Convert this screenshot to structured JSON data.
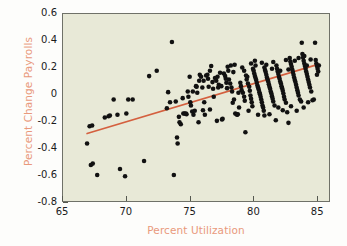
{
  "chart_data": {
    "type": "scatter",
    "title": "",
    "xlabel": "Percent Utilization",
    "ylabel": "Percent Change Payrolls",
    "xlim": [
      65,
      86
    ],
    "ylim": [
      -0.8,
      0.6
    ],
    "xticks": [
      65,
      70,
      75,
      80,
      85
    ],
    "xtick_labels": [
      "65",
      "70",
      "75",
      "80",
      "85"
    ],
    "yticks": [
      -0.8,
      -0.6,
      -0.4,
      -0.2,
      0,
      0.2,
      0.4,
      0.6
    ],
    "ytick_labels": [
      "-0.8",
      "-0.6",
      "-0.4",
      "-0.2",
      "0",
      "0.2",
      "0.4",
      "0.6"
    ],
    "grid": false,
    "legend": "none",
    "plot_background": "#e8e9d7",
    "point_color": "#111111",
    "point_size": 4.6,
    "label_color": "#e9997b",
    "tick_color": "#1b1b1b",
    "frame_color": "#6f7168",
    "series": [
      {
        "name": "Percent Change Payrolls vs Percent Utilization",
        "marker": "filled-circle",
        "points": [
          [
            66.9,
            -0.37
          ],
          [
            67.1,
            -0.24
          ],
          [
            67.3,
            -0.235
          ],
          [
            67.2,
            -0.53
          ],
          [
            67.35,
            -0.52
          ],
          [
            67.7,
            -0.605
          ],
          [
            68.3,
            -0.175
          ],
          [
            68.6,
            -0.165
          ],
          [
            68.7,
            -0.16
          ],
          [
            69.0,
            -0.04
          ],
          [
            69.3,
            -0.155
          ],
          [
            69.5,
            -0.56
          ],
          [
            69.9,
            -0.615
          ],
          [
            70.0,
            -0.145
          ],
          [
            70.15,
            -0.04
          ],
          [
            70.5,
            -0.04
          ],
          [
            71.4,
            -0.5
          ],
          [
            71.8,
            0.135
          ],
          [
            72.4,
            0.175
          ],
          [
            73.2,
            -0.105
          ],
          [
            73.45,
            -0.06
          ],
          [
            73.6,
            0.39
          ],
          [
            73.75,
            -0.605
          ],
          [
            73.9,
            -0.055
          ],
          [
            74.0,
            -0.325
          ],
          [
            74.05,
            -0.37
          ],
          [
            74.2,
            -0.21
          ],
          [
            74.3,
            -0.225
          ],
          [
            74.45,
            -0.03
          ],
          [
            74.5,
            -0.145
          ],
          [
            74.6,
            -0.145
          ],
          [
            74.7,
            -0.145
          ],
          [
            74.75,
            -0.15
          ],
          [
            74.85,
            0.02
          ],
          [
            74.9,
            -0.02
          ],
          [
            75.0,
            0.13
          ],
          [
            75.05,
            -0.06
          ],
          [
            75.1,
            -0.085
          ],
          [
            75.2,
            -0.13
          ],
          [
            75.3,
            -0.155
          ],
          [
            75.4,
            -0.125
          ],
          [
            75.5,
            0.06
          ],
          [
            75.55,
            0.055
          ],
          [
            75.6,
            0.01
          ],
          [
            75.7,
            -0.21
          ],
          [
            75.8,
            0.145
          ],
          [
            75.9,
            0.13
          ],
          [
            76.0,
            0.05
          ],
          [
            76.1,
            0.1
          ],
          [
            76.15,
            -0.06
          ],
          [
            76.2,
            -0.155
          ],
          [
            76.3,
            0.14
          ],
          [
            76.4,
            0.145
          ],
          [
            76.5,
            0.055
          ],
          [
            76.6,
            0.175
          ],
          [
            76.7,
            0.21
          ],
          [
            76.8,
            0.09
          ],
          [
            76.85,
            0.04
          ],
          [
            76.9,
            -0.02
          ],
          [
            77.0,
            0.12
          ],
          [
            77.1,
            0.1
          ],
          [
            77.2,
            0.13
          ],
          [
            77.25,
            0.05
          ],
          [
            77.3,
            0.07
          ],
          [
            77.4,
            0.16
          ],
          [
            77.5,
            0.06
          ],
          [
            77.55,
            -0.19
          ],
          [
            77.6,
            -0.185
          ],
          [
            77.7,
            0.155
          ],
          [
            77.8,
            0.135
          ],
          [
            77.85,
            0.115
          ],
          [
            77.9,
            0.085
          ],
          [
            78.0,
            0.205
          ],
          [
            78.05,
            0.175
          ],
          [
            78.1,
            0.11
          ],
          [
            78.2,
            0.08
          ],
          [
            78.3,
            0.05
          ],
          [
            78.35,
            0.02
          ],
          [
            78.4,
            -0.065
          ],
          [
            78.5,
            -0.04
          ],
          [
            78.6,
            -0.145
          ],
          [
            78.7,
            -0.15
          ],
          [
            78.75,
            -0.155
          ],
          [
            78.8,
            -0.15
          ],
          [
            78.9,
            -0.1
          ],
          [
            79.0,
            0.085
          ],
          [
            79.05,
            0.06
          ],
          [
            79.1,
            0.03
          ],
          [
            79.2,
            0.01
          ],
          [
            79.3,
            -0.02
          ],
          [
            79.35,
            -0.05
          ],
          [
            79.4,
            -0.285
          ],
          [
            79.5,
            0.11
          ],
          [
            79.55,
            0.13
          ],
          [
            79.6,
            0.08
          ],
          [
            79.7,
            0.055
          ],
          [
            79.75,
            0.025
          ],
          [
            79.8,
            -0.01
          ],
          [
            79.85,
            -0.035
          ],
          [
            79.9,
            -0.06
          ],
          [
            79.95,
            -0.09
          ],
          [
            80.0,
            0.19
          ],
          [
            80.05,
            0.175
          ],
          [
            80.1,
            0.155
          ],
          [
            80.15,
            0.135
          ],
          [
            80.2,
            0.12
          ],
          [
            80.25,
            0.105
          ],
          [
            80.3,
            0.085
          ],
          [
            80.35,
            0.065
          ],
          [
            80.4,
            0.05
          ],
          [
            80.45,
            0.035
          ],
          [
            80.5,
            0.015
          ],
          [
            80.55,
            0.0
          ],
          [
            80.6,
            -0.02
          ],
          [
            80.65,
            -0.04
          ],
          [
            80.7,
            -0.06
          ],
          [
            80.75,
            -0.085
          ],
          [
            80.8,
            -0.1
          ],
          [
            80.85,
            -0.125
          ],
          [
            80.9,
            0.2
          ],
          [
            80.95,
            0.18
          ],
          [
            81.0,
            0.165
          ],
          [
            81.05,
            0.145
          ],
          [
            81.1,
            0.125
          ],
          [
            81.15,
            0.11
          ],
          [
            81.2,
            0.095
          ],
          [
            81.25,
            0.075
          ],
          [
            81.3,
            0.055
          ],
          [
            81.35,
            0.04
          ],
          [
            81.4,
            0.02
          ],
          [
            81.45,
            0.005
          ],
          [
            81.5,
            -0.015
          ],
          [
            81.55,
            -0.035
          ],
          [
            81.6,
            -0.055
          ],
          [
            81.7,
            -0.085
          ],
          [
            81.8,
            -0.195
          ],
          [
            81.85,
            0.215
          ],
          [
            81.9,
            0.19
          ],
          [
            81.95,
            0.17
          ],
          [
            82.0,
            0.15
          ],
          [
            82.05,
            0.13
          ],
          [
            82.1,
            0.115
          ],
          [
            82.15,
            0.095
          ],
          [
            82.2,
            0.08
          ],
          [
            82.25,
            0.06
          ],
          [
            82.3,
            0.045
          ],
          [
            82.35,
            0.025
          ],
          [
            82.4,
            0.005
          ],
          [
            82.45,
            -0.02
          ],
          [
            82.5,
            -0.04
          ],
          [
            82.6,
            -0.065
          ],
          [
            82.7,
            -0.135
          ],
          [
            82.8,
            -0.215
          ],
          [
            82.9,
            0.27
          ],
          [
            82.95,
            0.245
          ],
          [
            83.0,
            0.225
          ],
          [
            83.05,
            0.205
          ],
          [
            83.1,
            0.185
          ],
          [
            83.15,
            0.165
          ],
          [
            83.2,
            0.145
          ],
          [
            83.25,
            0.125
          ],
          [
            83.3,
            0.105
          ],
          [
            83.35,
            0.09
          ],
          [
            83.4,
            0.07
          ],
          [
            83.45,
            0.05
          ],
          [
            83.5,
            0.03
          ],
          [
            83.55,
            0.01
          ],
          [
            83.6,
            -0.01
          ],
          [
            83.7,
            -0.04
          ],
          [
            83.8,
            -0.055
          ],
          [
            83.85,
            0.385
          ],
          [
            83.9,
            0.3
          ],
          [
            83.95,
            0.275
          ],
          [
            84.0,
            0.25
          ],
          [
            84.05,
            0.23
          ],
          [
            84.1,
            0.21
          ],
          [
            84.15,
            0.19
          ],
          [
            84.2,
            0.17
          ],
          [
            84.25,
            0.15
          ],
          [
            84.3,
            0.13
          ],
          [
            84.35,
            0.11
          ],
          [
            84.4,
            0.09
          ],
          [
            84.45,
            0.07
          ],
          [
            84.5,
            0.05
          ],
          [
            84.6,
            0.02
          ],
          [
            84.7,
            -0.045
          ],
          [
            84.8,
            -0.04
          ],
          [
            84.9,
            0.385
          ],
          [
            84.95,
            0.255
          ],
          [
            85.0,
            0.23
          ],
          [
            85.05,
            0.21
          ],
          [
            85.1,
            0.19
          ],
          [
            85.15,
            0.17
          ],
          [
            85.2,
            0.215
          ],
          [
            73.3,
            0.015
          ],
          [
            74.15,
            -0.17
          ],
          [
            75.25,
            0.02
          ],
          [
            76.45,
            0.115
          ],
          [
            77.95,
            0.045
          ],
          [
            78.85,
            0.01
          ],
          [
            79.45,
            0.14
          ],
          [
            80.2,
            0.215
          ],
          [
            81.05,
            0.22
          ],
          [
            82.15,
            0.175
          ],
          [
            83.3,
            0.25
          ],
          [
            84.05,
            0.285
          ],
          [
            79.85,
            0.23
          ],
          [
            80.7,
            0.235
          ],
          [
            81.6,
            0.24
          ],
          [
            82.6,
            0.255
          ],
          [
            83.6,
            0.27
          ],
          [
            84.55,
            0.26
          ],
          [
            78.55,
            0.22
          ],
          [
            79.15,
            0.2
          ],
          [
            80.4,
            -0.155
          ],
          [
            81.3,
            -0.15
          ],
          [
            82.0,
            -0.1
          ],
          [
            83.0,
            -0.09
          ],
          [
            84.0,
            -0.1
          ],
          [
            76.05,
            -0.12
          ],
          [
            77.15,
            -0.2
          ],
          [
            78.25,
            0.215
          ],
          [
            79.65,
            -0.125
          ],
          [
            80.9,
            -0.16
          ],
          [
            82.35,
            -0.12
          ],
          [
            83.45,
            -0.125
          ],
          [
            84.35,
            -0.06
          ],
          [
            75.75,
            0.1
          ],
          [
            76.6,
            -0.115
          ],
          [
            78.45,
            0.165
          ],
          [
            79.3,
            0.175
          ],
          [
            80.15,
            0.25
          ],
          [
            81.5,
            0.19
          ],
          [
            82.8,
            0.185
          ],
          [
            84.25,
            0.215
          ],
          [
            85.05,
            0.145
          ]
        ]
      }
    ],
    "trendline": {
      "name": "regression-line",
      "color": "#d4603f",
      "width": 1.7,
      "x0": 66.9,
      "y0": -0.295,
      "x1": 85.2,
      "y1": 0.225
    }
  }
}
